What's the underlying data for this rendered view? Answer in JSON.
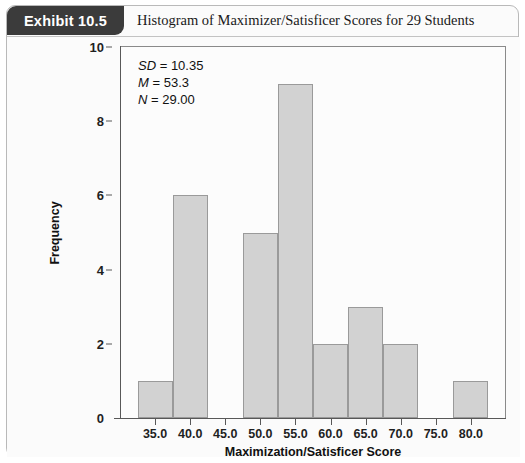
{
  "exhibit": {
    "badge_label": "Exhibit 10.5",
    "title": "Histogram of Maximizer/Satisficer Scores for 29 Students"
  },
  "stats": {
    "sd_label": "SD",
    "sd_value": "= 10.35",
    "mean_label": "M",
    "mean_value": "= 53.3",
    "n_label": "N",
    "n_value": "= 29.00"
  },
  "colors": {
    "bar_fill": "#d2d2d2",
    "bar_border": "#9a9a9a",
    "badge_bg": "#3b3b3b",
    "axis": "#585858",
    "plot_bg": "#fcfcfc",
    "card_bg": "#fbfbfb"
  },
  "chart_data": {
    "type": "bar",
    "title": "Histogram of Maximizer/Satisficer Scores for 29 Students",
    "xlabel": "Maximization/Satisficer Score",
    "ylabel": "Frequency",
    "categories": [
      "35.0",
      "40.0",
      "45.0",
      "50.0",
      "55.0",
      "60.0",
      "65.0",
      "70.0",
      "75.0",
      "80.0"
    ],
    "values": [
      1,
      6,
      0,
      5,
      9,
      2,
      3,
      2,
      0,
      1
    ],
    "bin_width": 5,
    "ylim": [
      0,
      10
    ],
    "xlim": [
      32.5,
      82.5
    ],
    "ytick_labels": [
      "0",
      "2",
      "4",
      "6",
      "8",
      "10"
    ],
    "yticks": [
      0,
      2,
      4,
      6,
      8,
      10
    ],
    "grid": false,
    "legend": false,
    "annotations": [
      "SD = 10.35",
      "M = 53.3",
      "N = 29.00"
    ]
  }
}
